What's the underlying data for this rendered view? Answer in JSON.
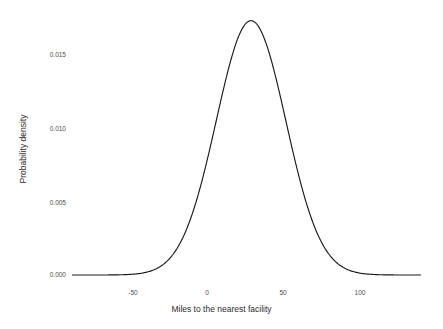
{
  "chart_data": {
    "type": "line",
    "title": "",
    "xlabel": "Miles to the nearest facility",
    "ylabel": "Probability density",
    "xlim": [
      -90,
      140
    ],
    "ylim": [
      0.0,
      0.0178
    ],
    "grid": false,
    "legend": null,
    "xticks": [
      "-50",
      "0",
      "50",
      "100"
    ],
    "xtick_values": [
      -50,
      0,
      50,
      100
    ],
    "yticks": [
      "0.000",
      "0.005",
      "0.010",
      "0.015"
    ],
    "ytick_values": [
      0.0,
      0.005,
      0.01,
      0.015
    ],
    "series": [
      {
        "name": "Probability density",
        "color": "#1a1a1a",
        "distribution": "normal",
        "mean": 28,
        "sd": 23,
        "peak_value": 0.01734,
        "peak_x": 28,
        "x": [
          -90,
          -85,
          -80,
          -75,
          -70,
          -65,
          -60,
          -55,
          -50,
          -45,
          -40,
          -35,
          -30,
          -25,
          -20,
          -15,
          -10,
          -5,
          0,
          5,
          10,
          15,
          20,
          25,
          28,
          30,
          35,
          40,
          45,
          50,
          55,
          60,
          65,
          70,
          75,
          80,
          85,
          90,
          95,
          100,
          105,
          110,
          115,
          120,
          125,
          130,
          135,
          140
        ],
        "values": [
          0.0,
          1e-07,
          2e-07,
          7e-07,
          2.1e-06,
          5.6e-06,
          1.4e-05,
          3.22e-05,
          6.81e-05,
          0.0001325,
          0.000237,
          0.00039,
          0.0005901,
          0.0008206,
          0.0010498,
          0.0012344,
          0.0013357,
          0.0013297,
          0.0012182,
          0.0010274,
          0.0007983,
          0.0005715,
          0.0003767,
          0.000229,
          0.000166,
          0.0001281,
          6.61e-05,
          3.15e-05,
          1.38e-05,
          5.6e-06,
          2.1e-06,
          7e-07,
          2e-07,
          1e-07,
          0.0,
          0.0,
          0.0,
          0.0,
          0.0,
          0.0,
          0.0,
          0.0,
          0.0,
          0.0,
          0.0,
          0.0,
          0.0,
          0.0
        ]
      }
    ],
    "note_values_are_placeholder": false
  },
  "axes": {
    "x_title": "Miles to the nearest facility",
    "y_title": "Probability density"
  }
}
